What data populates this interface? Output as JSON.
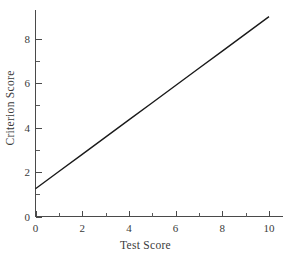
{
  "chart_data": {
    "type": "line",
    "title": "",
    "subtitle": "",
    "xlabel": "Test Score",
    "ylabel": "Criterion Score",
    "xlim": [
      0,
      10.6
    ],
    "ylim": [
      0,
      9.3
    ],
    "grid": false,
    "legend": null,
    "legend_position": "none",
    "x_ticks": [
      0,
      2,
      4,
      6,
      8,
      10
    ],
    "x_tick_labels": [
      "0",
      "2",
      "4",
      "6",
      "8",
      "10"
    ],
    "x_minor_ticks": [
      1,
      3,
      5,
      7,
      9
    ],
    "y_ticks": [
      0,
      2,
      4,
      6,
      8
    ],
    "y_tick_labels": [
      "0",
      "2",
      "4",
      "6",
      "8"
    ],
    "y_minor_ticks": [
      1,
      3,
      5,
      7
    ],
    "series": [
      {
        "name": "regression-line",
        "color": "#1a1a1a",
        "x": [
          0,
          10
        ],
        "values": [
          1.25,
          9.0
        ],
        "points": [
          [
            0,
            1.25
          ],
          [
            1,
            2.025
          ],
          [
            2,
            2.8
          ],
          [
            3,
            3.575
          ],
          [
            4,
            4.35
          ],
          [
            5,
            5.125
          ],
          [
            6,
            5.9
          ],
          [
            7,
            6.675
          ],
          [
            8,
            7.45
          ],
          [
            9,
            8.225
          ],
          [
            10,
            9.0
          ]
        ],
        "intercept": 1.25,
        "slope": 0.775
      }
    ],
    "annotations": []
  },
  "colors": {
    "background": "#ffffff",
    "axis": "#4a4a4a",
    "line": "#1a1a1a",
    "text": "#3a3a3a"
  }
}
